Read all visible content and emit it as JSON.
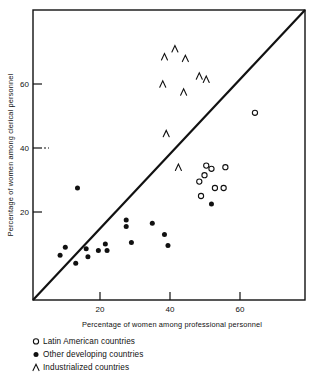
{
  "figure": {
    "background": "#ffffff",
    "ink": "#111111"
  },
  "chart_data": {
    "type": "scatter",
    "title": "",
    "xlabel": "Percentage of women among professional personnel",
    "ylabel": "Percentage of women among clerical personnel",
    "xlim": [
      0,
      79
    ],
    "ylim": [
      0,
      86
    ],
    "xticks": [
      20,
      40,
      60
    ],
    "yticks": [
      20,
      40,
      60
    ],
    "xtick_labels": [
      "20",
      "40",
      "60"
    ],
    "ytick_labels": [
      "20",
      "40",
      "60"
    ],
    "grid": false,
    "legend_position": "below-axis-left",
    "reference_line": {
      "label": "diagonal equality line",
      "from": [
        0,
        0
      ],
      "to": [
        79,
        86
      ]
    },
    "series": [
      {
        "name": "Latin American countries",
        "marker": "open-circle",
        "color": "#111111",
        "points": [
          [
            64.5,
            51.0
          ],
          [
            50.5,
            34.5
          ],
          [
            52.0,
            33.5
          ],
          [
            56.0,
            34.0
          ],
          [
            50.0,
            31.5
          ],
          [
            48.5,
            29.5
          ],
          [
            53.0,
            27.5
          ],
          [
            55.5,
            27.5
          ],
          [
            49.0,
            25.0
          ]
        ]
      },
      {
        "name": "Other developing countries",
        "marker": "filled-circle",
        "color": "#111111",
        "points": [
          [
            13.5,
            27.5
          ],
          [
            52.0,
            22.5
          ],
          [
            27.5,
            17.5
          ],
          [
            35.0,
            16.5
          ],
          [
            27.5,
            15.5
          ],
          [
            38.5,
            13.0
          ],
          [
            29.0,
            10.5
          ],
          [
            21.5,
            10.0
          ],
          [
            39.5,
            9.5
          ],
          [
            10.0,
            9.0
          ],
          [
            16.0,
            8.5
          ],
          [
            22.0,
            8.0
          ],
          [
            19.5,
            8.0
          ],
          [
            8.5,
            6.5
          ],
          [
            16.5,
            6.0
          ],
          [
            13.0,
            4.0
          ]
        ]
      },
      {
        "name": "Industrialized countries",
        "marker": "caret",
        "color": "#111111",
        "points": [
          [
            41.5,
            71.0
          ],
          [
            38.5,
            68.5
          ],
          [
            44.5,
            68.0
          ],
          [
            48.5,
            62.5
          ],
          [
            50.5,
            61.5
          ],
          [
            38.0,
            60.0
          ],
          [
            44.0,
            57.5
          ],
          [
            39.0,
            44.5
          ],
          [
            42.5,
            34.0
          ]
        ]
      }
    ]
  },
  "legend": {
    "items": [
      {
        "marker": "open-circle",
        "label": "Latin American countries"
      },
      {
        "marker": "filled-circle",
        "label": "Other developing countries"
      },
      {
        "marker": "caret",
        "label": "Industrialized countries"
      }
    ]
  }
}
